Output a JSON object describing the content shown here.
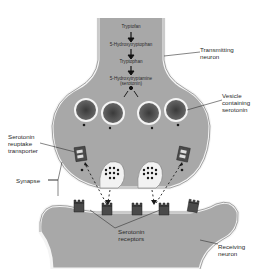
{
  "figure": {
    "colors": {
      "neuron_fill": "#a8a8a8",
      "membrane": "#f2f2f2",
      "vesicle": "#5a5a5a",
      "dot": "#2a2a2a",
      "background": "#ffffff"
    }
  },
  "pathway": {
    "steps": [
      "Tryptofan",
      "5-Hydroxytryptophan",
      "Tryptophan",
      "5-Hydroxytryptamine",
      "(serotonin)"
    ]
  },
  "labels": {
    "transmitting_neuron": [
      "Transmitting",
      "neuron"
    ],
    "vesicle": [
      "Vesicle",
      "containing",
      "serotonin"
    ],
    "reuptake": [
      "Serotonin",
      "reuptake",
      "transporter"
    ],
    "synapse": "Synapse",
    "receptors": [
      "Serotonin",
      "receptors"
    ],
    "receiving_neuron": [
      "Receiving",
      "neuron"
    ]
  }
}
